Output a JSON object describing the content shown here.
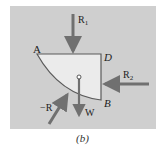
{
  "diagram": {
    "caption": "(b)",
    "points": {
      "A": "A",
      "D": "D",
      "B": "B"
    },
    "forces": {
      "R1": {
        "label": "R",
        "subscript": "1"
      },
      "R2": {
        "label": "R",
        "subscript": "2"
      },
      "W": {
        "label": "W"
      },
      "negR": {
        "label": "−R"
      }
    },
    "colors": {
      "background_panel": "#cfcfcf",
      "body_fill": "#ebebeb",
      "outline": "#5a5a5a",
      "arrow": "#707070"
    }
  }
}
